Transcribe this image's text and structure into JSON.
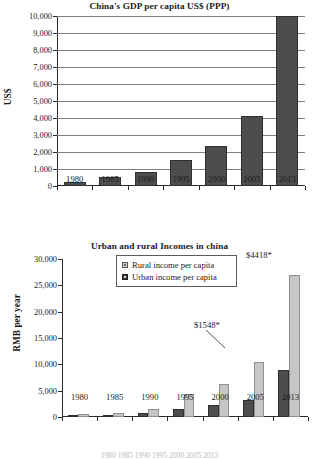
{
  "figure1": {
    "title": "China's GDP per capita US$ (PPP)",
    "ylabel": "US$",
    "ytick_labels": [
      "10,000",
      "9,000",
      "8,000",
      "7,000",
      "6,000",
      "5,000",
      "4,000",
      "3,000",
      "2,000",
      "1,000",
      "0"
    ],
    "xtick_labels": [
      "1980",
      "1985",
      "1990",
      "1995",
      "2000",
      "2005",
      "2013"
    ]
  },
  "figure2": {
    "title": "Urban and rural Incomes in china",
    "ylabel": "RMB per year",
    "ytick_labels": [
      "30,000",
      "25,000",
      "20,000",
      "15,000",
      "10,000",
      "5,000",
      "0"
    ],
    "xtick_labels": [
      "1980",
      "1985",
      "1990",
      "1995",
      "2000",
      "2005",
      "2013"
    ],
    "legend": {
      "item1": "Rural income per capita",
      "item2": "Urban income per capita"
    },
    "annotations": {
      "urban_2013": "$1548*",
      "rural_2013": "$4418*"
    }
  },
  "footer_text": "1980    1985    1990    1995    2000    2005    2013",
  "colors": {
    "dark_bar": "#4d4d4d",
    "light_bar": "#c6c6c6",
    "gridline": "#7e7e7e",
    "axis": "#2a2a2a",
    "text": "#1b1b1b"
  },
  "chart_data": [
    {
      "type": "bar",
      "title": "China's GDP per capita US$ (PPP)",
      "xlabel": "",
      "ylabel": "US$",
      "categories": [
        "1980",
        "1985",
        "1990",
        "1995",
        "2000",
        "2005",
        "2013"
      ],
      "values": [
        250,
        520,
        810,
        1520,
        2380,
        4100,
        10000
      ],
      "ylim": [
        0,
        10000
      ],
      "ytick_values": [
        0,
        1000,
        2000,
        3000,
        4000,
        5000,
        6000,
        7000,
        8000,
        9000,
        10000
      ],
      "grid": true,
      "legend": false,
      "series_color": "#4d4d4d"
    },
    {
      "type": "bar",
      "title": "Urban and rural Incomes in china",
      "xlabel": "",
      "ylabel": "RMB per year",
      "categories": [
        "1980",
        "1985",
        "1990",
        "1995",
        "2000",
        "2005",
        "2013"
      ],
      "series": [
        {
          "name": "Urban income per capita",
          "color": "#4d4d4d",
          "values": [
            100,
            400,
            700,
            1550,
            2300,
            3200,
            8900
          ]
        },
        {
          "name": "Rural income per capita",
          "color": "#c6c6c6",
          "values": [
            500,
            800,
            1550,
            4300,
            6300,
            10500,
            27000
          ]
        }
      ],
      "ylim": [
        0,
        30000
      ],
      "ytick_values": [
        0,
        5000,
        10000,
        15000,
        20000,
        25000,
        30000
      ],
      "grid": false,
      "legend": true,
      "legend_position": "upper center",
      "annotations": [
        {
          "text": "$1548*",
          "points_to": "Urban income per capita 2013"
        },
        {
          "text": "$4418*",
          "points_to": "Rural income per capita 2013"
        }
      ]
    }
  ]
}
